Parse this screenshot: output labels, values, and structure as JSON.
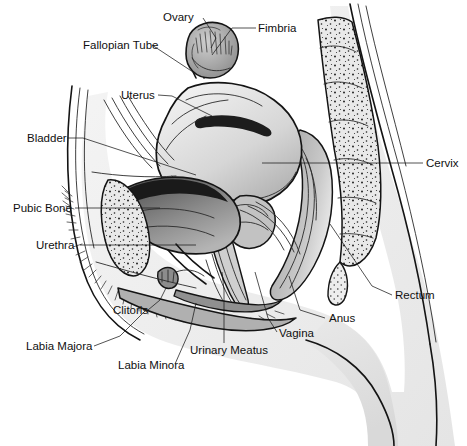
{
  "image": {
    "kind": "anatomical-illustration",
    "subject": "Female pelvis — midsagittal section",
    "width": 467,
    "height": 446,
    "style": "black-and-white pen-and-ink medical line drawing with stippling and grey wash",
    "background_color": "#ffffff",
    "line_color": "#141414",
    "label_color": "#101010"
  },
  "labels": [
    {
      "id": "ovary",
      "text": "Ovary",
      "x": 163,
      "y": 21,
      "anchor": "start",
      "leader": [
        [
          203,
          18
        ],
        [
          216,
          38
        ],
        [
          211,
          48
        ]
      ]
    },
    {
      "id": "fimbria",
      "text": "Fimbria",
      "x": 258,
      "y": 32,
      "anchor": "start",
      "leader": [
        [
          256,
          28
        ],
        [
          232,
          28
        ],
        [
          212,
          55
        ]
      ]
    },
    {
      "id": "fallopian-tube",
      "text": "Fallopian Tube",
      "x": 83,
      "y": 49,
      "anchor": "start",
      "leader": [
        [
          152,
          45
        ],
        [
          196,
          74
        ]
      ]
    },
    {
      "id": "uterus",
      "text": "Uterus",
      "x": 121,
      "y": 99,
      "anchor": "start",
      "leader": [
        [
          158,
          95
        ],
        [
          172,
          96
        ],
        [
          212,
          116
        ]
      ]
    },
    {
      "id": "bladder",
      "text": "Bladder",
      "x": 27,
      "y": 142,
      "anchor": "start",
      "leader": [
        [
          67,
          138
        ],
        [
          83,
          138
        ],
        [
          196,
          175
        ]
      ]
    },
    {
      "id": "cervix",
      "text": "Cervix",
      "x": 426,
      "y": 167,
      "anchor": "start",
      "leader": [
        [
          423,
          163
        ],
        [
          262,
          163
        ]
      ]
    },
    {
      "id": "pubic-bone",
      "text": "Pubic Bone",
      "x": 13,
      "y": 212,
      "anchor": "start",
      "leader": [
        [
          75,
          208
        ],
        [
          160,
          208
        ]
      ]
    },
    {
      "id": "urethra",
      "text": "Urethra",
      "x": 36,
      "y": 249,
      "anchor": "start",
      "leader": [
        [
          80,
          245
        ],
        [
          196,
          245
        ]
      ]
    },
    {
      "id": "rectum",
      "text": "Rectum",
      "x": 395,
      "y": 299,
      "anchor": "start",
      "leader": [
        [
          392,
          295
        ],
        [
          372,
          286
        ],
        [
          330,
          224
        ]
      ]
    },
    {
      "id": "clitoris",
      "text": "Clitoris",
      "x": 113,
      "y": 314,
      "anchor": "start",
      "leader": [
        [
          148,
          310
        ],
        [
          160,
          300
        ],
        [
          166,
          288
        ]
      ]
    },
    {
      "id": "anus",
      "text": "Anus",
      "x": 329,
      "y": 322,
      "anchor": "start",
      "leader": [
        [
          325,
          318
        ],
        [
          300,
          310
        ],
        [
          289,
          276
        ]
      ]
    },
    {
      "id": "vagina",
      "text": "Vagina",
      "x": 279,
      "y": 337,
      "anchor": "start",
      "leader": [
        [
          277,
          332
        ],
        [
          268,
          318
        ],
        [
          255,
          272
        ]
      ]
    },
    {
      "id": "labia-majora",
      "text": "Labia Majora",
      "x": 26,
      "y": 350,
      "anchor": "start",
      "leader": [
        [
          94,
          346
        ],
        [
          120,
          336
        ],
        [
          146,
          310
        ]
      ]
    },
    {
      "id": "urinary-meatus",
      "text": "Urinary Meatus",
      "x": 190,
      "y": 354,
      "anchor": "start",
      "leader": [
        [
          224,
          343
        ],
        [
          224,
          290
        ],
        [
          222,
          272
        ]
      ]
    },
    {
      "id": "labia-minora",
      "text": "Labia Minora",
      "x": 118,
      "y": 369,
      "anchor": "start",
      "leader": [
        [
          175,
          364
        ],
        [
          190,
          330
        ],
        [
          196,
          303
        ]
      ]
    }
  ],
  "structures": [
    {
      "id": "abdominal-wall",
      "name": "Abdominal wall / body contour"
    },
    {
      "id": "uterus-body",
      "name": "Uterus"
    },
    {
      "id": "uterine-cavity",
      "name": "Uterine cavity"
    },
    {
      "id": "ovary-body",
      "name": "Ovary"
    },
    {
      "id": "fallopian-tube-body",
      "name": "Fallopian tube"
    },
    {
      "id": "fimbria-body",
      "name": "Fimbriae"
    },
    {
      "id": "bladder-body",
      "name": "Urinary bladder"
    },
    {
      "id": "pubic-bone-body",
      "name": "Pubic bone (symphysis), stippled"
    },
    {
      "id": "sacrum-body",
      "name": "Sacrum / coccyx with vertebral segments, stippled"
    },
    {
      "id": "rectum-body",
      "name": "Rectum"
    },
    {
      "id": "vagina-canal",
      "name": "Vaginal canal"
    },
    {
      "id": "cervix-body",
      "name": "Cervix"
    },
    {
      "id": "urethra-canal",
      "name": "Urethra"
    },
    {
      "id": "clitoris-body",
      "name": "Clitoris"
    },
    {
      "id": "labia-majora-body",
      "name": "Labia majora"
    },
    {
      "id": "labia-minora-body",
      "name": "Labia minora"
    },
    {
      "id": "pubic-hair",
      "name": "Pubic hair"
    },
    {
      "id": "thigh",
      "name": "Thigh / buttock contour"
    }
  ],
  "palette": {
    "ink": "#141414",
    "mid_grey": "#b9b9b9",
    "light_grey": "#dcdcdc",
    "pale": "#efefef",
    "dark_grey": "#6e6e6e",
    "deep": "#3a3a3a"
  }
}
